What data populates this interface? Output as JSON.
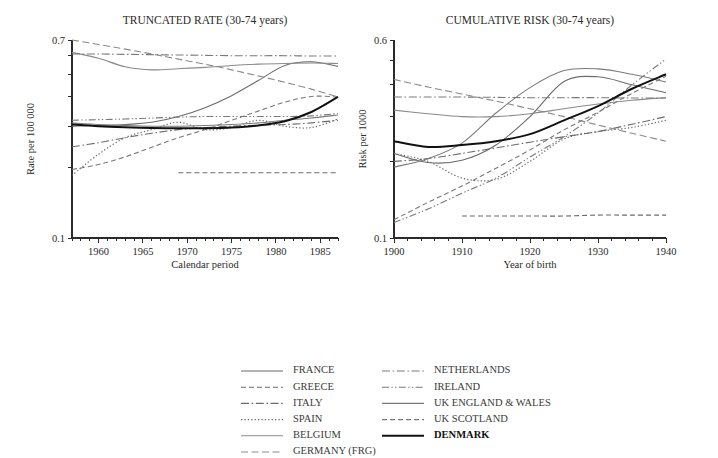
{
  "figure": {
    "background": "#ffffff",
    "width": 718,
    "height": 458
  },
  "panels": [
    {
      "id": "truncated-rate",
      "title": "TRUNCATED RATE (30-74 years)",
      "xlabel": "Calendar period",
      "ylabel": "Rate per 100 000"
    },
    {
      "id": "cumulative-risk",
      "title": "CUMULATIVE RISK (30-74 years)",
      "xlabel": "Year of birth",
      "ylabel": "Risk per 1000"
    }
  ],
  "legend": {
    "columns": [
      [
        {
          "label": "FRANCE",
          "key": "france"
        },
        {
          "label": "GREECE",
          "key": "greece"
        },
        {
          "label": "ITALY",
          "key": "italy"
        },
        {
          "label": "SPAIN",
          "key": "spain"
        },
        {
          "label": "BELGIUM",
          "key": "belgium"
        },
        {
          "label": "GERMANY (FRG)",
          "key": "germany"
        }
      ],
      [
        {
          "label": "NETHERLANDS",
          "key": "netherlands"
        },
        {
          "label": "IRELAND",
          "key": "ireland"
        },
        {
          "label": "UK ENGLAND & WALES",
          "key": "uk_ew"
        },
        {
          "label": "UK SCOTLAND",
          "key": "uk_scot"
        },
        {
          "label": "DENMARK",
          "key": "denmark"
        }
      ]
    ]
  },
  "style": {
    "series_color": "#6b6b6b",
    "highlight_color": "#111111",
    "axis_color": "#2b2b2b",
    "text_color": "#2a2a2a"
  },
  "chart_data": [
    {
      "type": "line",
      "title": "TRUNCATED RATE (30-74 years)",
      "xlabel": "Calendar period",
      "ylabel": "Rate per 100 000",
      "xlim": [
        1957,
        1987
      ],
      "ylim": [
        0.1,
        0.7
      ],
      "yscale": "log",
      "grid": false,
      "legend_position": "below-figure",
      "xticks": [
        1960,
        1965,
        1970,
        1975,
        1980,
        1985
      ],
      "xticks_minor_step": 1,
      "yticks": [
        0.1,
        0.2,
        0.3,
        0.4,
        0.5,
        0.6,
        0.7
      ],
      "ytick_labels": [
        "0.1",
        "",
        "",
        "",
        "",
        "",
        "0.7"
      ],
      "x": [
        1957,
        1960,
        1963,
        1966,
        1969,
        1972,
        1975,
        1978,
        1981,
        1984,
        1987
      ],
      "series": [
        {
          "name": "FRANCE",
          "style": "solid",
          "color": "#6b6b6b",
          "width": 1.1,
          "values": [
            0.3,
            0.302,
            0.305,
            0.312,
            0.33,
            0.36,
            0.405,
            0.47,
            0.545,
            0.565,
            0.54
          ]
        },
        {
          "name": "GREECE",
          "style": "dashed",
          "color": "#6b6b6b",
          "width": 1.1,
          "values": [
            null,
            null,
            null,
            null,
            0.19,
            0.19,
            0.19,
            0.19,
            0.19,
            0.19,
            0.19
          ]
        },
        {
          "name": "ITALY",
          "style": "dashdot",
          "color": "#6b6b6b",
          "width": 1.1,
          "values": [
            0.245,
            0.255,
            0.268,
            0.28,
            0.29,
            0.296,
            0.3,
            0.303,
            0.305,
            0.31,
            0.318
          ]
        },
        {
          "name": "SPAIN",
          "style": "dotted",
          "color": "#6b6b6b",
          "width": 1.2,
          "values": [
            0.185,
            0.228,
            0.268,
            0.29,
            0.312,
            0.29,
            0.296,
            0.318,
            0.3,
            0.296,
            0.322
          ]
        },
        {
          "name": "BELGIUM",
          "style": "solid",
          "color": "#8a8a8a",
          "width": 1.1,
          "values": [
            0.62,
            0.585,
            0.538,
            0.522,
            0.528,
            0.535,
            0.545,
            0.552,
            0.556,
            0.558,
            0.556
          ]
        },
        {
          "name": "GERMANY (FRG)",
          "style": "longdash",
          "color": "#8a8a8a",
          "width": 1.1,
          "values": [
            0.7,
            0.67,
            0.64,
            0.61,
            0.58,
            0.552,
            0.522,
            0.492,
            0.462,
            0.432,
            0.4
          ]
        },
        {
          "name": "NETHERLANDS",
          "style": "dashdot",
          "color": "#7a7a7a",
          "width": 1.1,
          "values": [
            0.61,
            0.61,
            0.608,
            0.606,
            0.604,
            0.602,
            0.6,
            0.6,
            0.6,
            0.598,
            0.598
          ]
        },
        {
          "name": "IRELAND",
          "style": "dashdotdot",
          "color": "#7a7a7a",
          "width": 1.1,
          "values": [
            0.318,
            0.32,
            0.322,
            0.325,
            0.328,
            0.33,
            0.33,
            0.33,
            0.33,
            0.332,
            0.34
          ]
        },
        {
          "name": "UK ENGLAND & WALES",
          "style": "solid",
          "color": "#7a7a7a",
          "width": 1.1,
          "values": [
            0.31,
            0.305,
            0.302,
            0.3,
            0.3,
            0.302,
            0.305,
            0.31,
            0.318,
            0.325,
            0.335
          ]
        },
        {
          "name": "UK SCOTLAND",
          "style": "dashed",
          "color": "#7a7a7a",
          "width": 1.1,
          "values": [
            0.196,
            0.206,
            0.222,
            0.244,
            0.268,
            0.29,
            0.318,
            0.348,
            0.38,
            0.402,
            0.4
          ]
        },
        {
          "name": "DENMARK",
          "style": "solid",
          "color": "#111111",
          "width": 2.0,
          "values": [
            0.305,
            0.3,
            0.297,
            0.295,
            0.294,
            0.294,
            0.296,
            0.302,
            0.315,
            0.345,
            0.4
          ]
        }
      ]
    },
    {
      "type": "line",
      "title": "CUMULATIVE RISK (30-74 years)",
      "xlabel": "Year of birth",
      "ylabel": "Risk per 1000",
      "xlim": [
        1900,
        1940
      ],
      "ylim": [
        0.1,
        0.6
      ],
      "yscale": "log",
      "grid": false,
      "legend_position": "below-figure",
      "xticks": [
        1900,
        1910,
        1920,
        1930,
        1940
      ],
      "xticks_minor_step": 2,
      "yticks": [
        0.1,
        0.2,
        0.3,
        0.4,
        0.5,
        0.6
      ],
      "ytick_labels": [
        "0.1",
        "",
        "",
        "",
        "",
        "0.6"
      ],
      "x": [
        1900,
        1905,
        1910,
        1915,
        1920,
        1925,
        1930,
        1935,
        1940
      ],
      "series": [
        {
          "name": "FRANCE",
          "style": "solid",
          "color": "#6b6b6b",
          "width": 1.1,
          "values": [
            0.215,
            0.198,
            0.202,
            0.232,
            0.3,
            0.412,
            0.43,
            0.4,
            0.372
          ]
        },
        {
          "name": "GREECE",
          "style": "dashed",
          "color": "#6b6b6b",
          "width": 1.1,
          "values": [
            null,
            null,
            0.122,
            0.122,
            0.122,
            0.122,
            0.123,
            0.123,
            0.123
          ]
        },
        {
          "name": "ITALY",
          "style": "dashdot",
          "color": "#6b6b6b",
          "width": 1.1,
          "values": [
            0.2,
            0.205,
            0.215,
            0.226,
            0.238,
            0.25,
            0.262,
            0.28,
            0.3
          ]
        },
        {
          "name": "SPAIN",
          "style": "dotted",
          "color": "#6b6b6b",
          "width": 1.2,
          "values": [
            0.215,
            0.2,
            0.172,
            0.17,
            0.2,
            0.245,
            0.262,
            0.272,
            0.29
          ]
        },
        {
          "name": "BELGIUM",
          "style": "solid",
          "color": "#8a8a8a",
          "width": 1.1,
          "values": [
            0.318,
            0.308,
            0.3,
            0.3,
            0.308,
            0.322,
            0.336,
            0.348,
            0.356
          ]
        },
        {
          "name": "GERMANY (FRG)",
          "style": "longdash",
          "color": "#8a8a8a",
          "width": 1.1,
          "values": [
            0.42,
            0.392,
            0.368,
            0.345,
            0.322,
            0.3,
            0.278,
            0.258,
            0.24
          ]
        },
        {
          "name": "NETHERLANDS",
          "style": "dashdot",
          "color": "#7a7a7a",
          "width": 1.1,
          "values": [
            0.358,
            0.358,
            0.358,
            0.357,
            0.356,
            0.356,
            0.356,
            0.355,
            0.355
          ]
        },
        {
          "name": "IRELAND",
          "style": "dashdotdot",
          "color": "#7a7a7a",
          "width": 1.1,
          "values": [
            0.115,
            0.13,
            0.15,
            0.172,
            0.208,
            0.25,
            0.31,
            0.4,
            0.505
          ]
        },
        {
          "name": "UK ENGLAND & WALES",
          "style": "solid",
          "color": "#7a7a7a",
          "width": 1.1,
          "values": [
            0.19,
            0.205,
            0.236,
            0.31,
            0.39,
            0.455,
            0.462,
            0.44,
            0.41
          ]
        },
        {
          "name": "UK SCOTLAND",
          "style": "dashed",
          "color": "#7a7a7a",
          "width": 1.1,
          "values": [
            0.118,
            0.138,
            0.16,
            0.188,
            0.222,
            0.266,
            0.312,
            0.37,
            0.432
          ]
        },
        {
          "name": "DENMARK",
          "style": "solid",
          "color": "#111111",
          "width": 2.0,
          "values": [
            0.24,
            0.228,
            0.232,
            0.24,
            0.256,
            0.29,
            0.33,
            0.386,
            0.44
          ]
        }
      ]
    }
  ]
}
